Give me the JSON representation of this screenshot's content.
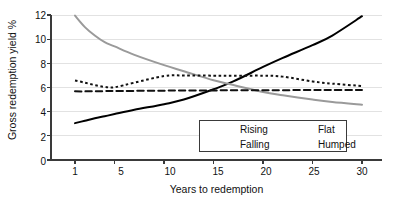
{
  "chart_data": {
    "type": "line",
    "title": "",
    "xlabel": "Years to redemption",
    "ylabel": "Gross redemption yield %",
    "xlim": [
      0,
      31
    ],
    "ylim": [
      0,
      12
    ],
    "xticks": [
      1,
      5,
      10,
      15,
      20,
      25,
      30
    ],
    "xtick_labels": [
      "1",
      "5",
      "10",
      "15",
      "20",
      "25",
      "30"
    ],
    "yticks": [
      0,
      2,
      4,
      6,
      8,
      10,
      12
    ],
    "ytick_labels": [
      "0",
      "2",
      "4",
      "6",
      "8",
      "10",
      "12"
    ],
    "grid": "horizontal",
    "legend_position": "lower-center-right",
    "x": [
      1,
      2,
      3,
      4,
      5,
      7,
      10,
      12,
      15,
      17,
      20,
      22,
      25,
      27,
      30
    ],
    "series": [
      {
        "name": "Rising",
        "label": "Rising",
        "style": "solid",
        "color": "#000000",
        "width": 2.0,
        "values": [
          3.05,
          3.25,
          3.45,
          3.62,
          3.8,
          4.15,
          4.62,
          5.0,
          5.85,
          6.5,
          7.7,
          8.45,
          9.5,
          10.3,
          11.9
        ]
      },
      {
        "name": "Falling",
        "label": "Falling",
        "style": "solid",
        "color": "#9a9a9a",
        "width": 2.0,
        "values": [
          11.95,
          11.0,
          10.3,
          9.75,
          9.4,
          8.7,
          7.85,
          7.35,
          6.6,
          6.2,
          5.62,
          5.35,
          5.0,
          4.8,
          4.58
        ]
      },
      {
        "name": "Flat",
        "label": "Flat",
        "style": "dashed",
        "color": "#111111",
        "width": 2.0,
        "values": [
          5.68,
          5.68,
          5.69,
          5.7,
          5.71,
          5.72,
          5.74,
          5.75,
          5.76,
          5.77,
          5.78,
          5.78,
          5.79,
          5.79,
          5.8
        ]
      },
      {
        "name": "Humped",
        "label": "Humped",
        "style": "dotted",
        "color": "#111111",
        "width": 2.0,
        "values": [
          6.58,
          6.4,
          6.2,
          6.05,
          6.02,
          6.4,
          6.95,
          7.0,
          6.98,
          6.97,
          6.98,
          6.9,
          6.5,
          6.32,
          6.12
        ]
      }
    ]
  },
  "axes": {
    "x_title": "Years to redemption",
    "y_title": "Gross redemption yield %",
    "x_tick_labels": [
      "1",
      "5",
      "10",
      "15",
      "20",
      "25",
      "30"
    ],
    "y_tick_labels": [
      "0",
      "2",
      "4",
      "6",
      "8",
      "10",
      "12"
    ]
  },
  "legend": {
    "entries": [
      {
        "label": "Rising",
        "style": "solid",
        "color": "#000000"
      },
      {
        "label": "Flat",
        "style": "dashed",
        "color": "#111111"
      },
      {
        "label": "Falling",
        "style": "solid",
        "color": "#9a9a9a"
      },
      {
        "label": "Humped",
        "style": "dotted",
        "color": "#111111"
      }
    ]
  },
  "colors": {
    "axis": "#3a3a3a",
    "grid": "#e2e2e2",
    "text": "#111111",
    "rising": "#000000",
    "falling": "#9a9a9a",
    "flat": "#111111",
    "humped": "#111111",
    "background": "#ffffff"
  }
}
